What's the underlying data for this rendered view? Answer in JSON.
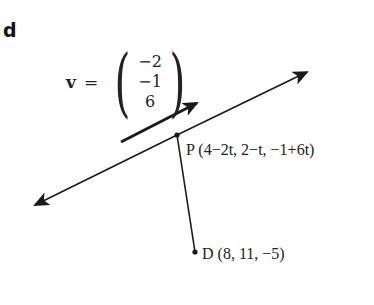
{
  "part_label": "d",
  "direction_vector": {
    "name": "v",
    "equals": "=",
    "components": [
      "−2",
      "−1",
      "6"
    ]
  },
  "points": {
    "P": {
      "label": "P",
      "coords": "(4−2t, 2−t, −1+6t)"
    },
    "D": {
      "label": "D",
      "coords": "(8, 11, −5)"
    }
  },
  "colors": {
    "line": "#1a1a1a",
    "text": "#222222",
    "background": "#ffffff"
  }
}
